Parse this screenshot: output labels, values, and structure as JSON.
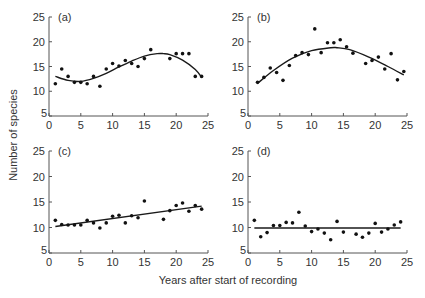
{
  "figure": {
    "ylabel": "Number of species",
    "xlabel": "Years after start of recording"
  },
  "chart_data": [
    {
      "type": "scatter",
      "panel": "(a)",
      "title": "(a)",
      "xlabel": "Years after start of recording",
      "ylabel": "Number of species",
      "xlim": [
        0,
        25
      ],
      "ylim": [
        5,
        25
      ],
      "xticks": [
        0,
        5,
        10,
        15,
        20,
        25
      ],
      "yticks": [
        5,
        10,
        15,
        20,
        25
      ],
      "fit": "cubic",
      "fit_curve": {
        "x": [
          1,
          3,
          5,
          7,
          9,
          11,
          13,
          15,
          17,
          18,
          19,
          21,
          23,
          24
        ],
        "y": [
          13.0,
          12.2,
          12.0,
          12.6,
          13.6,
          14.9,
          16.1,
          17.1,
          17.6,
          17.6,
          17.4,
          16.3,
          14.4,
          12.8
        ]
      },
      "x": [
        1,
        2,
        3,
        4,
        5,
        6,
        7,
        8,
        9,
        10,
        11,
        12,
        13,
        14,
        15,
        16,
        19,
        20,
        21,
        22,
        23,
        24
      ],
      "y": [
        11.5,
        14.5,
        13,
        11.8,
        11.8,
        11.5,
        13,
        11,
        14.5,
        15.6,
        15.1,
        16.2,
        15.6,
        15,
        16.6,
        18.4,
        16.6,
        17.6,
        17.6,
        17.6,
        13,
        13
      ]
    },
    {
      "type": "scatter",
      "panel": "(b)",
      "title": "(b)",
      "xlabel": "Years after start of recording",
      "ylabel": "Number of species",
      "xlim": [
        0,
        25
      ],
      "ylim": [
        5,
        25
      ],
      "xticks": [
        0,
        5,
        10,
        15,
        20,
        25
      ],
      "yticks": [
        5,
        10,
        15,
        20,
        25
      ],
      "fit": "quadratic",
      "fit_curve": {
        "x": [
          1.5,
          4,
          7,
          10,
          13,
          14,
          16,
          19,
          22,
          24.5
        ],
        "y": [
          11.6,
          14.2,
          16.7,
          18.2,
          18.8,
          18.8,
          18.4,
          16.9,
          15.0,
          13.3
        ]
      },
      "x": [
        1.5,
        2.5,
        3.5,
        4.5,
        5.5,
        6.5,
        7.5,
        8.5,
        9.5,
        10.5,
        11.5,
        12.5,
        13.5,
        14.5,
        15.5,
        16.5,
        18.5,
        19.5,
        20.5,
        21.5,
        22.5,
        23.5,
        24.5
      ],
      "y": [
        11.8,
        12.8,
        14.7,
        13.8,
        12.2,
        15.2,
        17.2,
        17.8,
        17.4,
        22.6,
        17.8,
        19.8,
        19.8,
        20.4,
        19.0,
        17.7,
        15.6,
        16.2,
        16.9,
        14.5,
        17.6,
        12.3,
        14.0
      ]
    },
    {
      "type": "scatter",
      "panel": "(c)",
      "title": "(c)",
      "xlabel": "Years after start of recording",
      "ylabel": "Number of species",
      "xlim": [
        0,
        25
      ],
      "ylim": [
        5,
        25
      ],
      "xticks": [
        0,
        5,
        10,
        15,
        20,
        25
      ],
      "yticks": [
        5,
        10,
        15,
        20,
        25
      ],
      "fit": "linear",
      "fit_curve": {
        "x": [
          1,
          24
        ],
        "y": [
          10.2,
          14.2
        ]
      },
      "x": [
        1,
        2,
        3,
        4,
        5,
        6,
        7,
        8,
        9,
        10,
        11,
        12,
        13,
        14,
        15,
        18,
        19,
        20,
        21,
        22,
        23,
        24
      ],
      "y": [
        11.4,
        10.6,
        10.5,
        10.5,
        10.5,
        11.4,
        10.9,
        9.9,
        10.9,
        12.2,
        12.4,
        10.9,
        12.3,
        11.9,
        15.2,
        11.6,
        13.3,
        14.3,
        14.8,
        13.2,
        14.3,
        13.6
      ]
    },
    {
      "type": "scatter",
      "panel": "(d)",
      "title": "(d)",
      "xlabel": "Years after start of recording",
      "ylabel": "Number of species",
      "xlim": [
        0,
        25
      ],
      "ylim": [
        5,
        25
      ],
      "xticks": [
        0,
        5,
        10,
        15,
        20,
        25
      ],
      "yticks": [
        5,
        10,
        15,
        20,
        25
      ],
      "fit": "horizontal",
      "fit_curve": {
        "x": [
          1,
          24
        ],
        "y": [
          9.9,
          9.9
        ]
      },
      "x": [
        1,
        2,
        3,
        4,
        5,
        6,
        7,
        8,
        9,
        10,
        11,
        12,
        13,
        14,
        15,
        17,
        18,
        19,
        20,
        21,
        22,
        23,
        24
      ],
      "y": [
        11.4,
        8.2,
        9.0,
        10.4,
        10.4,
        11.0,
        10.9,
        13.0,
        10.3,
        9.2,
        9.7,
        8.9,
        7.6,
        11.2,
        9.1,
        8.7,
        8.1,
        8.9,
        10.8,
        9.1,
        9.7,
        10.5,
        11.1
      ]
    }
  ]
}
